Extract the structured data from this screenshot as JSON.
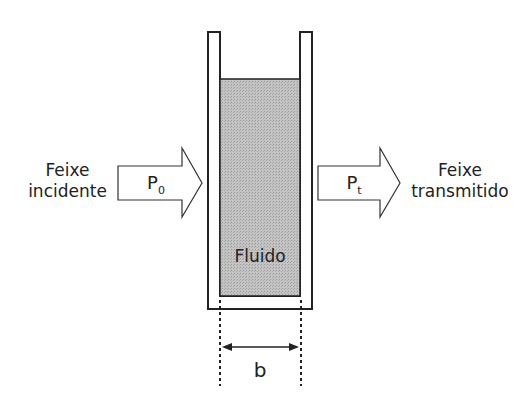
{
  "diagram": {
    "left_label_line1": "Feixe",
    "left_label_line2": "incidente",
    "right_label_line1": "Feixe",
    "right_label_line2": "transmitido",
    "incident_power": "P",
    "incident_sub": "0",
    "transmitted_power": "P",
    "transmitted_sub": "t",
    "fluid_label": "Fluido",
    "path_length_label": "b",
    "colors": {
      "fluid": "#b8b8b8",
      "stroke": "#222222"
    }
  }
}
